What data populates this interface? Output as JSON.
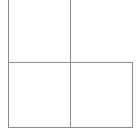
{
  "diagram": {
    "type": "grid-cells",
    "line_color": "#8c8c8c",
    "background": "#ffffff",
    "cells": [
      {
        "name": "top-left",
        "row": 0,
        "col": 0,
        "open_top": true
      },
      {
        "name": "bottom-left",
        "row": 1,
        "col": 0
      },
      {
        "name": "bottom-right",
        "row": 1,
        "col": 1
      }
    ],
    "lines": {
      "left_vertical": {
        "x": 8,
        "y1": 0,
        "y2": 127
      },
      "middle_vertical": {
        "x": 70,
        "y1": 0,
        "y2": 127
      },
      "right_vertical": {
        "x": 132,
        "y1": 62,
        "y2": 127
      },
      "middle_horizontal": {
        "y": 62,
        "x1": 8,
        "x2": 132
      },
      "bottom_horizontal": {
        "y": 127,
        "x1": 8,
        "x2": 132
      }
    }
  }
}
